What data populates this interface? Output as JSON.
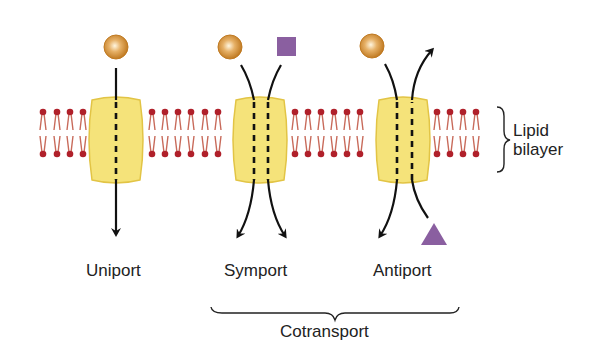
{
  "labels": {
    "uniport": "Uniport",
    "symport": "Symport",
    "antiport": "Antiport",
    "cotransport": "Cotransport",
    "lipid_line1": "Lipid",
    "lipid_line2": "bilayer"
  },
  "colors": {
    "protein_fill": "#f5e37a",
    "protein_stroke": "#e2c445",
    "lipid_head": "#b0202a",
    "lipid_tail": "#c86a5a",
    "sphere": "#d08a2c",
    "square": "#8a5fa0",
    "triangle": "#8a5fa0",
    "arrow": "#111111"
  },
  "transporters": [
    {
      "name": "uniport",
      "substrates": [
        "sphere"
      ],
      "direction": "in"
    },
    {
      "name": "symport",
      "substrates": [
        "sphere",
        "square"
      ],
      "direction": "both-in"
    },
    {
      "name": "antiport",
      "substrates": [
        "sphere",
        "triangle"
      ],
      "direction": "opposite"
    }
  ]
}
